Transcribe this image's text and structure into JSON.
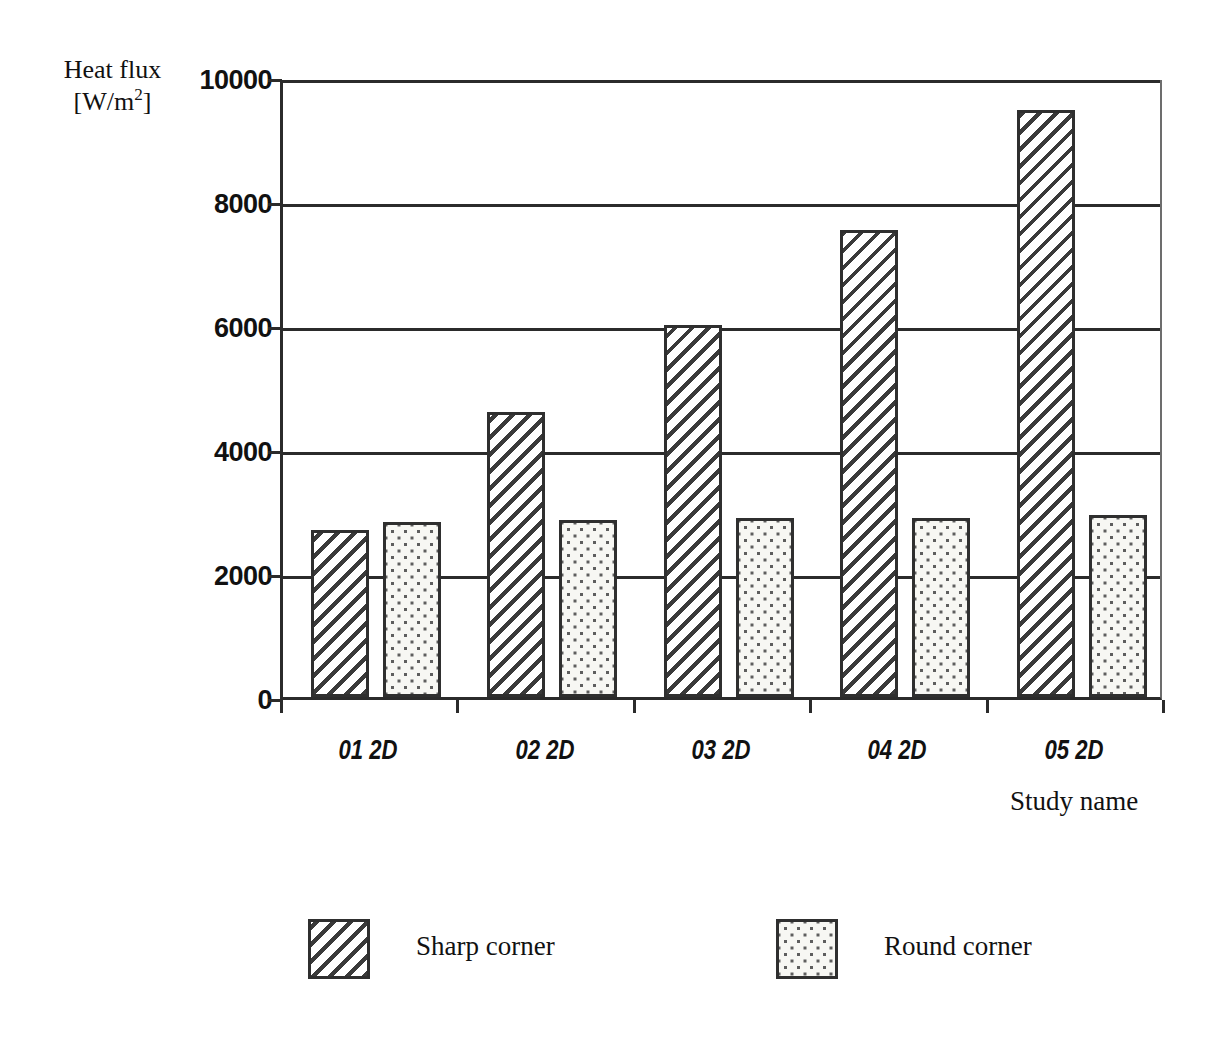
{
  "chart_data": {
    "type": "bar",
    "title": "",
    "subtitle": "",
    "xlabel": "Study name",
    "ylabel_line1": "Heat flux",
    "ylabel_line2_pre": "[W/m",
    "ylabel_line2_sup": "2",
    "ylabel_line2_post": "]",
    "ylabel": "Heat flux [W/m2]",
    "categories": [
      "01 2D",
      "02 2D",
      "03 2D",
      "04 2D",
      "05 2D"
    ],
    "series": [
      {
        "name": "Sharp corner",
        "pattern": "diagonal-hatch",
        "values": [
          2700,
          4600,
          6000,
          7530,
          9470
        ]
      },
      {
        "name": "Round corner",
        "pattern": "dotted-stipple",
        "values": [
          2820,
          2860,
          2880,
          2890,
          2930
        ]
      }
    ],
    "ylim": [
      0,
      10000
    ],
    "yticks": [
      0,
      2000,
      4000,
      6000,
      8000,
      10000
    ],
    "ytick_labels": [
      "0",
      "2000",
      "4000",
      "6000",
      "8000",
      "10000"
    ],
    "grid": true,
    "grid_axis": "y",
    "legend_position": "bottom",
    "colors": {
      "line": "#2b2b2b",
      "bar_border": "#2f2f2f",
      "hatch": "#3a3a3a",
      "stipple": "#5e5e5e",
      "background": "#ffffff"
    }
  },
  "legend": {
    "entries": [
      {
        "label": "Sharp corner",
        "pattern": "diagonal-hatch"
      },
      {
        "label": "Round corner",
        "pattern": "dotted-stipple"
      }
    ]
  }
}
